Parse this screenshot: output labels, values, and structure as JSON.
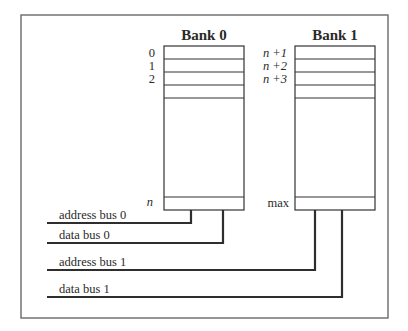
{
  "diagram": {
    "type": "memory-bank-interleaving",
    "banks": [
      {
        "title": "Bank 0",
        "top_labels": [
          "0",
          "1",
          "2"
        ],
        "bottom_label": "n"
      },
      {
        "title": "Bank 1",
        "top_labels": [
          "n +1",
          "n +2",
          "n +3"
        ],
        "bottom_label": "max"
      }
    ],
    "buses": [
      {
        "label": "address bus 0",
        "connects_to": "Bank 0"
      },
      {
        "label": "data bus 0",
        "connects_to": "Bank 0"
      },
      {
        "label": "address bus 1",
        "connects_to": "Bank 1"
      },
      {
        "label": "data bus 1",
        "connects_to": "Bank 1"
      }
    ]
  },
  "colors": {
    "frame": "#6a6a6a",
    "lines": "#2e2e2e",
    "text": "#2a2a2a",
    "background": "#ffffff"
  }
}
